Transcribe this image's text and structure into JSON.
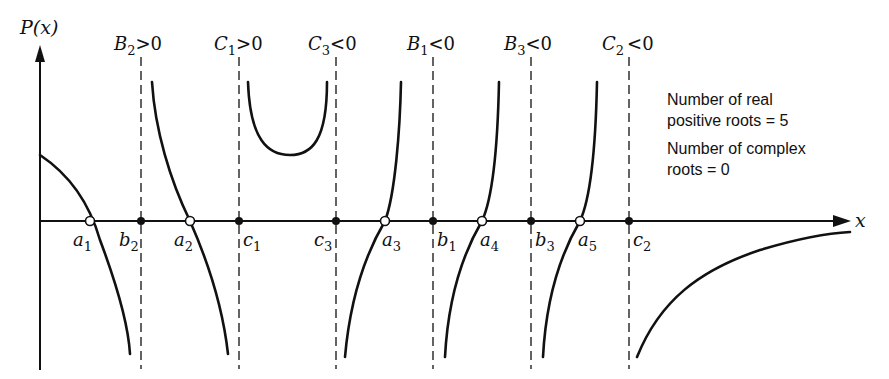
{
  "figure": {
    "y_axis_label": "P(x)",
    "x_axis_label": "x",
    "asymptote_labels": [
      {
        "name": "B",
        "sub": "2",
        "rel": ">0"
      },
      {
        "name": "C",
        "sub": "1",
        "rel": ">0"
      },
      {
        "name": "C",
        "sub": "3",
        "rel": "<0"
      },
      {
        "name": "B",
        "sub": "1",
        "rel": "<0"
      },
      {
        "name": "B",
        "sub": "3",
        "rel": "<0"
      },
      {
        "name": "C",
        "sub": "2",
        "rel": "<0"
      }
    ],
    "pole_points": [
      {
        "name": "b",
        "sub": "2"
      },
      {
        "name": "c",
        "sub": "1"
      },
      {
        "name": "c",
        "sub": "3"
      },
      {
        "name": "b",
        "sub": "1"
      },
      {
        "name": "b",
        "sub": "3"
      },
      {
        "name": "c",
        "sub": "2"
      }
    ],
    "root_points": [
      {
        "name": "a",
        "sub": "1"
      },
      {
        "name": "a",
        "sub": "2"
      },
      {
        "name": "a",
        "sub": "3"
      },
      {
        "name": "a",
        "sub": "4"
      },
      {
        "name": "a",
        "sub": "5"
      }
    ],
    "notes": {
      "line1": "Number of real",
      "line2": "positive roots = 5",
      "line3": "Number of complex",
      "line4": "roots = 0"
    }
  }
}
